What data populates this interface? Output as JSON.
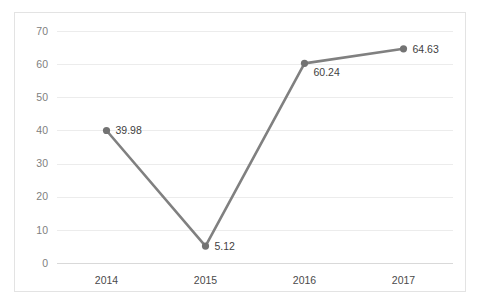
{
  "chart_data": {
    "type": "line",
    "title": "",
    "subtitle": "",
    "xlabel": "",
    "ylabel": "",
    "categories": [
      "2014",
      "2015",
      "2016",
      "2017"
    ],
    "values": [
      39.98,
      5.12,
      60.24,
      64.63
    ],
    "data_labels": [
      "39.98",
      "5.12",
      "60.24",
      "64.63"
    ],
    "series": [
      {
        "name": "",
        "values": [
          39.98,
          5.12,
          60.24,
          64.63
        ]
      }
    ],
    "ylim": [
      0,
      70
    ],
    "ytick_step": 10,
    "ytick_labels": [
      "0",
      "10",
      "20",
      "30",
      "40",
      "50",
      "60",
      "70"
    ],
    "ytick_values": [
      0,
      10,
      20,
      30,
      40,
      50,
      60,
      70
    ],
    "grid": true,
    "grid_axis": "y",
    "legend": false,
    "legend_position": "none",
    "markers": true,
    "colors": {
      "line": "#808080",
      "marker": "#737373",
      "gridline": "#ececec",
      "axis": "#d9d9d9",
      "tick_text": "#808080",
      "category_text": "#4a4a4a",
      "value_text": "#3f3f3f",
      "border": "#e3e3e3",
      "background": "#ffffff"
    }
  }
}
